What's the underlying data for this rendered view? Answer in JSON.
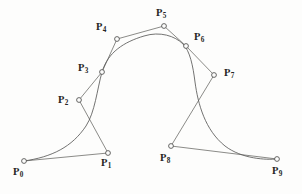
{
  "figure": {
    "background_color": "#fdfdfc",
    "curve_color": "#5a5a58",
    "polygon_color": "#6d6d6a",
    "node_fill": "#fdfdfc",
    "node_stroke": "#4d4d4b",
    "width": 302,
    "height": 194
  },
  "chart_data": {
    "type": "line",
    "title": "",
    "xlabel": "",
    "ylabel": "",
    "grid": false,
    "legend": "none",
    "xlim": [
      0,
      302
    ],
    "ylim": [
      194,
      0
    ],
    "series": [
      {
        "name": "control-polygon",
        "kind": "polyline",
        "points": [
          [
            24,
            161
          ],
          [
            108,
            153
          ],
          [
            79,
            100
          ],
          [
            102,
            72
          ],
          [
            117,
            39
          ],
          [
            164,
            26
          ],
          [
            186,
            46
          ],
          [
            214,
            75
          ],
          [
            171,
            146
          ],
          [
            277,
            159
          ]
        ]
      },
      {
        "name": "spline-curve",
        "kind": "smooth",
        "path": "M 24,161 C 52,157 72,147 86,126 C 95,112 97,90 102,72 C 108,52 124,42 144,36 C 160,31 175,36 183,44 C 190,51 193,66 195,82 C 198,104 205,130 225,146 C 242,159 266,160 277,159"
      }
    ],
    "control_points": [
      {
        "id": "P0",
        "index": 0,
        "x": 24,
        "y": 161,
        "label": "P",
        "subscript": "0",
        "label_pos": "below-left"
      },
      {
        "id": "P1",
        "index": 1,
        "x": 108,
        "y": 153,
        "label": "P",
        "subscript": "1",
        "label_pos": "below-right"
      },
      {
        "id": "P2",
        "index": 2,
        "x": 79,
        "y": 100,
        "label": "P",
        "subscript": "2",
        "label_pos": "left"
      },
      {
        "id": "P3",
        "index": 3,
        "x": 102,
        "y": 72,
        "label": "P",
        "subscript": "3",
        "label_pos": "left"
      },
      {
        "id": "P4",
        "index": 4,
        "x": 117,
        "y": 39,
        "label": "P",
        "subscript": "4",
        "label_pos": "upper-left"
      },
      {
        "id": "P5",
        "index": 5,
        "x": 164,
        "y": 26,
        "label": "P",
        "subscript": "5",
        "label_pos": "above"
      },
      {
        "id": "P6",
        "index": 6,
        "x": 186,
        "y": 46,
        "label": "P",
        "subscript": "6",
        "label_pos": "upper-right"
      },
      {
        "id": "P7",
        "index": 7,
        "x": 214,
        "y": 75,
        "label": "P",
        "subscript": "7",
        "label_pos": "right"
      },
      {
        "id": "P8",
        "index": 8,
        "x": 171,
        "y": 146,
        "label": "P",
        "subscript": "8",
        "label_pos": "below-left"
      },
      {
        "id": "P9",
        "index": 9,
        "x": 277,
        "y": 159,
        "label": "P",
        "subscript": "9",
        "label_pos": "below-right"
      }
    ]
  },
  "labels": {
    "p0": "P",
    "p0_sub": "0",
    "p1": "P",
    "p1_sub": "1",
    "p2": "P",
    "p2_sub": "2",
    "p3": "P",
    "p3_sub": "3",
    "p4": "P",
    "p4_sub": "4",
    "p5": "P",
    "p5_sub": "5",
    "p6": "P",
    "p6_sub": "6",
    "p7": "P",
    "p7_sub": "7",
    "p8": "P",
    "p8_sub": "8",
    "p9": "P",
    "p9_sub": "9"
  }
}
